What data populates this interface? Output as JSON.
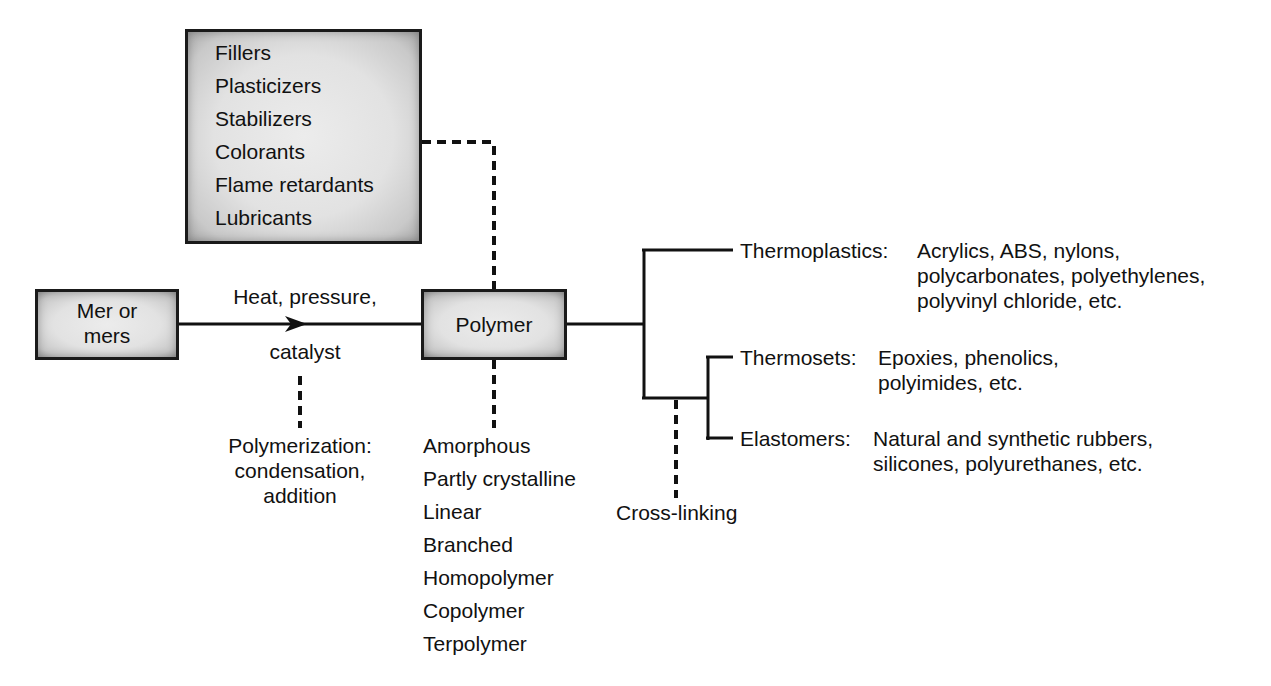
{
  "diagram": {
    "additives_box": {
      "items": [
        "Fillers",
        "Plasticizers",
        "Stabilizers",
        "Colorants",
        "Flame retardants",
        "Lubricants"
      ]
    },
    "input_box": {
      "line1": "Mer or",
      "line2": "mers"
    },
    "process_arrow": {
      "label_top": "Heat, pressure,",
      "label_bottom": "catalyst"
    },
    "polymerization_note": {
      "line1": "Polymerization:",
      "line2": "condensation,",
      "line3": "addition"
    },
    "output_box": {
      "label": "Polymer"
    },
    "polymer_structures": [
      "Amorphous",
      "Partly crystalline",
      "Linear",
      "Branched",
      "Homopolymer",
      "Copolymer",
      "Terpolymer"
    ],
    "categories": [
      {
        "name": "Thermoplastics:",
        "examples": [
          "Acrylics, ABS, nylons,",
          "polycarbonates, polyethylenes,",
          "polyvinyl chloride, etc."
        ]
      },
      {
        "name": "Thermosets:",
        "examples": [
          "Epoxies, phenolics,",
          "polyimides, etc."
        ]
      },
      {
        "name": "Elastomers:",
        "examples": [
          "Natural and synthetic rubbers,",
          "silicones, polyurethanes, etc."
        ]
      }
    ],
    "cross_link_label": "Cross-linking",
    "colors": {
      "line": "#111111",
      "box_fill": "#e4e4e4",
      "box_edge": "#1a1a1a",
      "background": "#ffffff"
    }
  }
}
